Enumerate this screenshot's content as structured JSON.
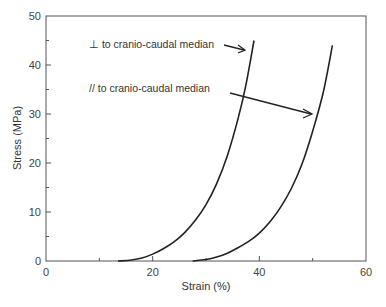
{
  "chart_data": {
    "type": "line",
    "title": "",
    "xlabel": "Strain (%)",
    "ylabel": "Stress (MPa)",
    "xlim": [
      0,
      60
    ],
    "ylim": [
      0,
      50
    ],
    "x_ticks": [
      0,
      20,
      40,
      60
    ],
    "x_minor_ticks": [
      10,
      30,
      50
    ],
    "y_ticks": [
      0,
      10,
      20,
      30,
      40,
      50
    ],
    "y_minor_ticks": [
      5,
      15,
      25,
      35,
      45
    ],
    "grid": false,
    "legend": "none (inline annotations with arrows)",
    "series": [
      {
        "name": "⊥ to cranio-caudal median",
        "x": [
          13.5,
          16,
          18,
          20,
          22,
          24,
          26,
          28,
          30,
          32,
          34,
          36,
          37.5,
          39
        ],
        "y": [
          0,
          0.2,
          0.6,
          1.4,
          2.5,
          3.9,
          5.8,
          8.3,
          11.5,
          15.8,
          21.5,
          29,
          36,
          45
        ]
      },
      {
        "name": "// to cranio-caudal median",
        "x": [
          27.5,
          30,
          32,
          34,
          36,
          38,
          40,
          42,
          44,
          46,
          48,
          50,
          52,
          53.7
        ],
        "y": [
          0,
          0.3,
          0.8,
          1.6,
          2.7,
          4.0,
          5.7,
          8.0,
          11.0,
          14.8,
          19.8,
          26.5,
          34.5,
          44
        ]
      }
    ],
    "annotations": [
      {
        "text": "⊥ to cranio-caudal median",
        "arrow_to": [
          37.5,
          42
        ]
      },
      {
        "text": "// to cranio-caudal median",
        "arrow_to": [
          50.5,
          30
        ]
      }
    ]
  },
  "labels": {
    "xlabel": "Strain (%)",
    "ylabel": "Stress (MPa)",
    "x_ticks": [
      "0",
      "20",
      "40",
      "60"
    ],
    "y_ticks": [
      "0",
      "10",
      "20",
      "30",
      "40",
      "50"
    ],
    "annot_perp": "⊥ to cranio-caudal median",
    "annot_par": "// to cranio-caudal median"
  }
}
